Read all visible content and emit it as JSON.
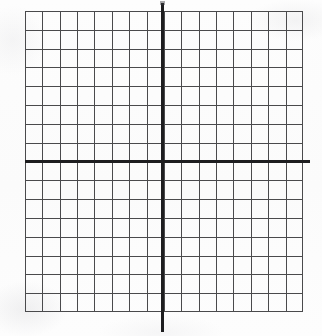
{
  "document": {
    "title": "Blank Cartesian coordinate grid",
    "kind": "graph-paper-worksheet"
  },
  "colors": {
    "background": "#fcfcfc",
    "grid_line": "#4a4a4c",
    "axis_line": "#1d1d1f"
  },
  "chart_data": {
    "type": "scatter",
    "title": "",
    "xlabel": "",
    "ylabel": "",
    "series": [],
    "x": [],
    "values": [],
    "annotations": [],
    "legend": null,
    "legend_position": "none",
    "grid": true,
    "xlim": [
      -8,
      8
    ],
    "ylim": [
      -8,
      8
    ],
    "x_major_ticks": 16,
    "y_major_ticks": 16,
    "xticklabels": [],
    "yticklabels": [],
    "axes_drawn": [
      "x-axis",
      "y-axis"
    ],
    "origin_at_center": true,
    "note": "Empty coordinate plane: 16 by 16 unit grid with bold x and y axes intersecting at the origin. No data plotted, no tick labels printed."
  },
  "grid": {
    "columns": 16,
    "rows": 16,
    "left_of_y_axis_columns": 8,
    "right_of_y_axis_columns": 8,
    "above_x_axis_rows": 8,
    "below_x_axis_rows": 8
  },
  "elements": {
    "x_axis_name": "x-axis",
    "y_axis_name": "y-axis",
    "origin_name": "origin"
  }
}
